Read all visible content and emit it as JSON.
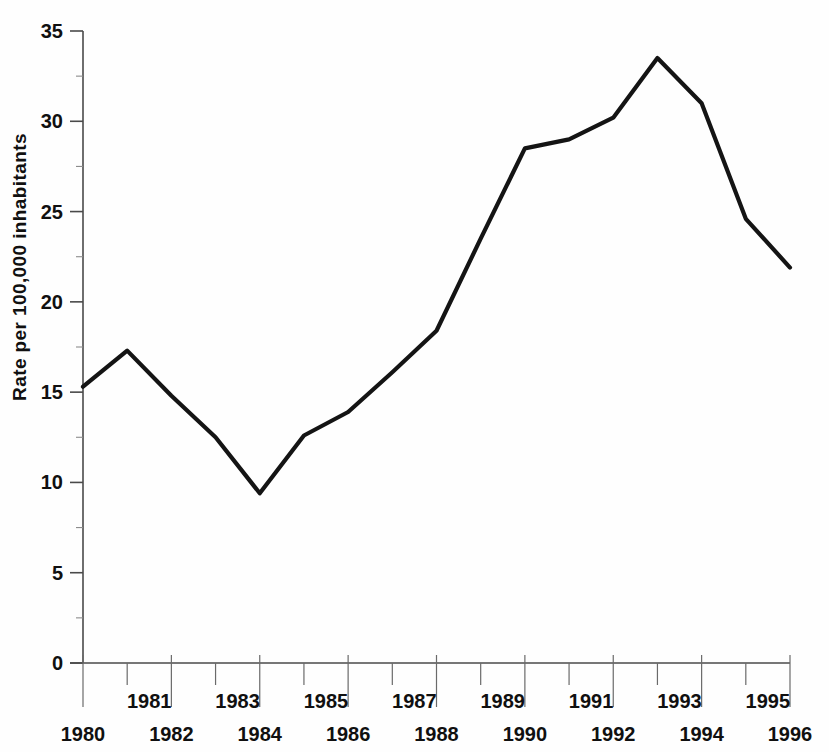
{
  "chart_data": {
    "type": "line",
    "title": "",
    "xlabel": "",
    "ylabel": "Rate per 100,000 inhabitants",
    "x": [
      1980,
      1981,
      1982,
      1983,
      1984,
      1985,
      1986,
      1987,
      1988,
      1989,
      1990,
      1991,
      1992,
      1993,
      1994,
      1995,
      1996
    ],
    "values": [
      15.3,
      17.3,
      14.8,
      12.5,
      9.4,
      12.6,
      13.9,
      16.1,
      18.4,
      23.5,
      28.5,
      29.0,
      30.2,
      33.5,
      31.0,
      24.6,
      21.9
    ],
    "series": [
      {
        "name": "Rate",
        "values": [
          15.3,
          17.3,
          14.8,
          12.5,
          9.4,
          12.6,
          13.9,
          16.1,
          18.4,
          23.5,
          28.5,
          29.0,
          30.2,
          33.5,
          31.0,
          24.6,
          21.9
        ]
      }
    ],
    "xlim": [
      1980,
      1996
    ],
    "ylim": [
      0,
      35
    ],
    "grid": false,
    "legend": false,
    "legend_position": "none",
    "line_color": "#141414"
  },
  "axes": {
    "y_title": "Rate per 100,000 inhabitants",
    "y_ticks": [
      {
        "value": 35,
        "label": "35"
      },
      {
        "value": 30,
        "label": "30"
      },
      {
        "value": 25,
        "label": "25"
      },
      {
        "value": 20,
        "label": "20"
      },
      {
        "value": 15,
        "label": "15"
      },
      {
        "value": 10,
        "label": "10"
      },
      {
        "value": 5,
        "label": "5"
      },
      {
        "value": 0,
        "label": "0"
      }
    ],
    "y_minor_ticks": [
      32.5,
      27.5,
      22.5,
      17.5,
      12.5,
      7.5,
      2.5
    ],
    "x_ticks_upper": [
      {
        "value": 1981,
        "label": "1981"
      },
      {
        "value": 1983,
        "label": "1983"
      },
      {
        "value": 1985,
        "label": "1985"
      },
      {
        "value": 1987,
        "label": "1987"
      },
      {
        "value": 1989,
        "label": "1989"
      },
      {
        "value": 1991,
        "label": "1991"
      },
      {
        "value": 1993,
        "label": "1993"
      },
      {
        "value": 1995,
        "label": "1995"
      }
    ],
    "x_ticks_lower": [
      {
        "value": 1980,
        "label": "1980"
      },
      {
        "value": 1982,
        "label": "1982"
      },
      {
        "value": 1984,
        "label": "1984"
      },
      {
        "value": 1986,
        "label": "1986"
      },
      {
        "value": 1988,
        "label": "1988"
      },
      {
        "value": 1990,
        "label": "1990"
      },
      {
        "value": 1992,
        "label": "1992"
      },
      {
        "value": 1994,
        "label": "1994"
      },
      {
        "value": 1996,
        "label": "1996"
      }
    ]
  },
  "colors": {
    "line": "#141414",
    "axis": "#4a4a4a",
    "text": "#101010",
    "background": "#fefefe"
  }
}
